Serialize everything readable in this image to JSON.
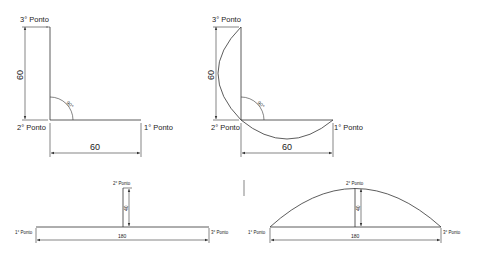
{
  "diagrams": {
    "top_left": {
      "p3": "3° Ponto",
      "p2": "2° Ponto",
      "p1": "1° Ponto",
      "dim_vertical": "60",
      "dim_horizontal": "60",
      "angle": "90°"
    },
    "top_right": {
      "p3": "3° Ponto",
      "p2": "2° Ponto",
      "p1": "1° Ponto",
      "dim_vertical": "60",
      "dim_horizontal": "60",
      "angle": "90°"
    },
    "bottom_left": {
      "p1": "1° Ponto",
      "p2": "2° Ponto",
      "p3": "3° Ponto",
      "dim_height": "40",
      "dim_width": "180"
    },
    "bottom_right": {
      "p1": "1° Ponto",
      "p2": "2° Ponto",
      "p3": "3° Ponto",
      "dim_height": "40",
      "dim_width": "180"
    }
  }
}
